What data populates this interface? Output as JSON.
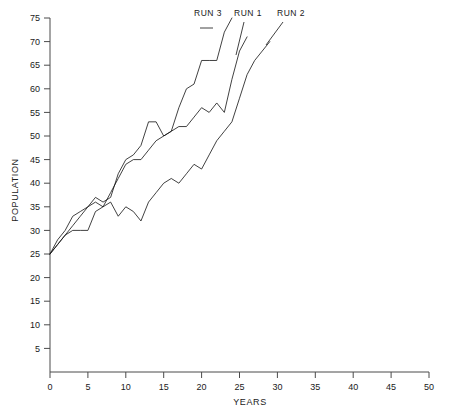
{
  "chart_data": {
    "type": "line",
    "title": "",
    "xlabel": "YEARS",
    "ylabel": "POPULATION",
    "xlim": [
      0,
      50
    ],
    "ylim": [
      0,
      75
    ],
    "xticks": [
      0,
      5,
      10,
      15,
      20,
      25,
      30,
      35,
      40,
      45,
      50
    ],
    "yticks": [
      0,
      5,
      10,
      15,
      20,
      25,
      30,
      35,
      40,
      45,
      50,
      55,
      60,
      65,
      70,
      75
    ],
    "grid": false,
    "legend_position": "inline-labels-top",
    "line_color": "#111111",
    "axis_color": "#4a4a4a",
    "series": [
      {
        "name": "RUN 1",
        "label": "RUN 1",
        "x": [
          0,
          1,
          2,
          3,
          4,
          5,
          6,
          7,
          8,
          9,
          10,
          11,
          12,
          13,
          14,
          15,
          16,
          17,
          18,
          19,
          20,
          21,
          22,
          23,
          24,
          25,
          26
        ],
        "values": [
          25,
          27,
          29,
          31,
          33,
          35,
          36,
          35,
          38,
          41,
          44,
          45,
          45,
          47,
          49,
          50,
          51,
          52,
          52,
          54,
          56,
          55,
          57,
          55,
          62,
          68,
          71
        ]
      },
      {
        "name": "RUN 2",
        "label": "RUN 2",
        "x": [
          0,
          1,
          2,
          3,
          4,
          5,
          6,
          7,
          8,
          9,
          10,
          11,
          12,
          13,
          14,
          15,
          16,
          17,
          18,
          19,
          20,
          21,
          22,
          23,
          24,
          25,
          26,
          27,
          28,
          29
        ],
        "values": [
          25,
          27,
          29,
          30,
          30,
          30,
          34,
          35,
          36,
          33,
          35,
          34,
          32,
          36,
          38,
          40,
          41,
          40,
          42,
          44,
          43,
          46,
          49,
          51,
          53,
          58,
          63,
          66,
          68,
          70
        ]
      },
      {
        "name": "RUN 3",
        "label": "RUN 3",
        "x": [
          0,
          1,
          2,
          3,
          4,
          5,
          6,
          7,
          8,
          9,
          10,
          11,
          12,
          13,
          14,
          15,
          16,
          17,
          18,
          19,
          20,
          21,
          22,
          23,
          24
        ],
        "values": [
          25,
          28,
          30,
          33,
          34,
          35,
          37,
          36,
          37,
          42,
          45,
          46,
          48,
          53,
          53,
          50,
          51,
          56,
          60,
          61,
          66,
          66,
          66,
          72,
          75
        ]
      }
    ]
  },
  "axes": {
    "x_title": "YEARS",
    "y_title": "POPULATION",
    "x_tick_labels": [
      "0",
      "5",
      "10",
      "15",
      "20",
      "25",
      "30",
      "35",
      "40",
      "45",
      "50"
    ],
    "y_tick_labels": [
      "5",
      "10",
      "15",
      "20",
      "25",
      "30",
      "35",
      "40",
      "45",
      "50",
      "55",
      "60",
      "65",
      "70",
      "75"
    ]
  },
  "labels": {
    "run1": "RUN 1",
    "run2": "RUN 2",
    "run3": "RUN 3"
  }
}
